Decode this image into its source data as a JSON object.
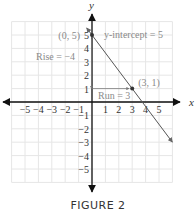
{
  "figure": {
    "caption": "FIGURE 2"
  },
  "chart_data": {
    "type": "line",
    "title": "",
    "xlabel": "x",
    "ylabel": "y",
    "xlim": [
      -6,
      6
    ],
    "ylim": [
      -6,
      6
    ],
    "grid": true,
    "x_ticks": [
      -5,
      -4,
      -3,
      -2,
      -1,
      1,
      2,
      3,
      4,
      5
    ],
    "y_ticks": [
      -5,
      -4,
      -3,
      -2,
      -1,
      1,
      2,
      3,
      4,
      5
    ],
    "x_tick_labels": [
      "−5",
      "−4",
      "−3",
      "−2",
      "−1",
      "1",
      "2",
      "3",
      "4",
      "5"
    ],
    "y_tick_labels": [
      "−5",
      "−4",
      "−3",
      "−2",
      "−1",
      "1",
      "2",
      "3",
      "4",
      "5"
    ],
    "series": [
      {
        "name": "line y = -4/3 x + 5",
        "x": [
          -0.4,
          6
        ],
        "y": [
          5.53,
          -3
        ]
      }
    ],
    "points": [
      {
        "x": 0,
        "y": 5,
        "label": "(0, 5)"
      },
      {
        "x": 3,
        "y": 1,
        "label": "(3, 1)"
      }
    ],
    "annotations": [
      {
        "text": "y-intercept = 5"
      },
      {
        "text": "Rise = −4"
      },
      {
        "text": "Run = 3"
      }
    ],
    "slope_triangle": {
      "rise": -4,
      "run": 3,
      "from": [
        0,
        5
      ],
      "corner": [
        0,
        1
      ],
      "to": [
        3,
        1
      ]
    }
  },
  "colors": {
    "axis": "#111111",
    "grid": "#e6e6e6",
    "line": "#555555",
    "annotation": "#8a8a8a",
    "tick_label": "#333333"
  }
}
